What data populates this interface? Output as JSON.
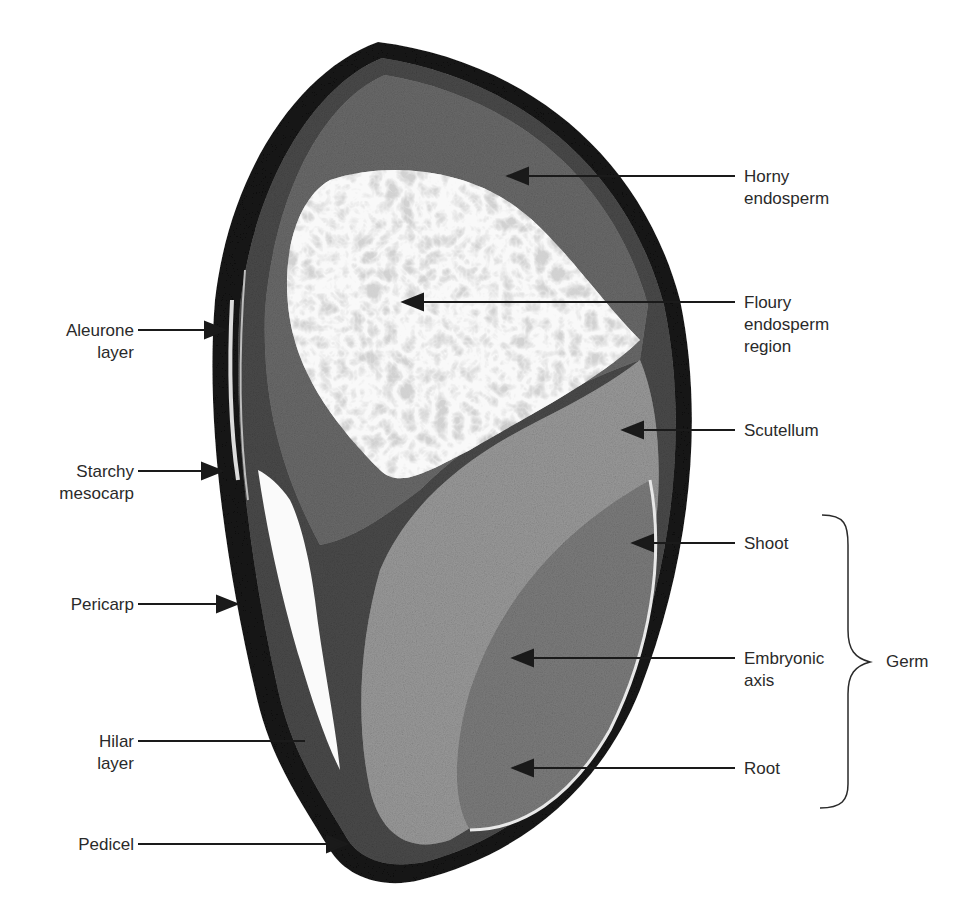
{
  "figure": {
    "colors": {
      "background": "#ffffff",
      "text": "#2a2a2a",
      "pericarp": "#111111",
      "horny_endosperm": "#5a5a5a",
      "floury_endosperm": "#f4f4f4",
      "scutellum": "#8a8a8a",
      "embryo": "#7a7a7a",
      "leader_line": "#1a1a1a"
    }
  },
  "labels_left": [
    {
      "id": "aleurone",
      "lines": [
        "Aleurone",
        "layer"
      ]
    },
    {
      "id": "starchy-mesocarp",
      "lines": [
        "Starchy",
        "mesocarp"
      ]
    },
    {
      "id": "pericarp",
      "lines": [
        "Pericarp"
      ]
    },
    {
      "id": "hilar",
      "lines": [
        "Hilar",
        "layer"
      ]
    },
    {
      "id": "pedicel",
      "lines": [
        "Pedicel"
      ]
    }
  ],
  "labels_right": [
    {
      "id": "horny-endosperm",
      "lines": [
        "Horny",
        "endosperm"
      ]
    },
    {
      "id": "floury-endosperm",
      "lines": [
        "Floury",
        "endosperm",
        "region"
      ]
    },
    {
      "id": "scutellum",
      "lines": [
        "Scutellum"
      ]
    },
    {
      "id": "shoot",
      "lines": [
        "Shoot"
      ]
    },
    {
      "id": "embryonic-axis",
      "lines": [
        "Embryonic",
        "axis"
      ]
    },
    {
      "id": "root",
      "lines": [
        "Root"
      ]
    }
  ],
  "group_label": {
    "id": "germ",
    "text": "Germ",
    "members": [
      "Shoot",
      "Embryonic axis",
      "Root"
    ]
  }
}
